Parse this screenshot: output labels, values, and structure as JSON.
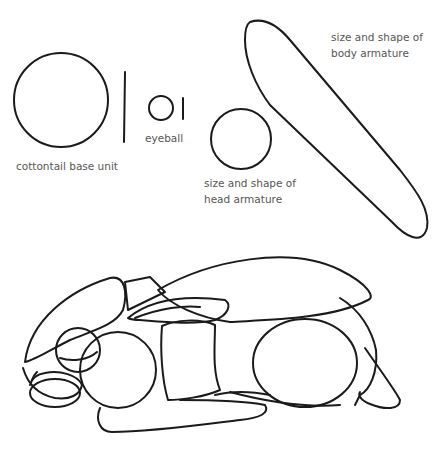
{
  "diagram": {
    "labels": {
      "base_unit": "cottontail base unit",
      "eyeball": "eyeball",
      "head_line1": "size and shape of",
      "head_line2": "head armature",
      "body_line1": "size and shape of",
      "body_line2": "body armature"
    },
    "colors": {
      "stroke": "#1a1a1a",
      "label": "#555555",
      "background": "#ffffff"
    }
  }
}
